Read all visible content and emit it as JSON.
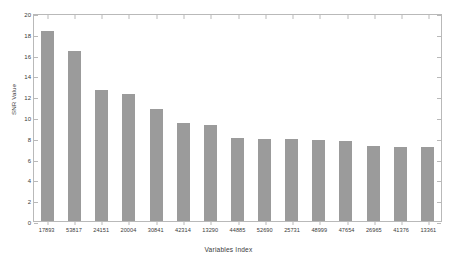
{
  "chart_data": {
    "type": "bar",
    "title": "",
    "xlabel": "Variables Index",
    "ylabel": "SNR Value",
    "categories": [
      "17893",
      "53817",
      "24151",
      "20004",
      "30841",
      "42314",
      "13290",
      "44885",
      "52690",
      "25731",
      "48999",
      "47654",
      "26965",
      "41376",
      "13361"
    ],
    "values": [
      18.3,
      16.3,
      12.6,
      12.2,
      10.8,
      9.4,
      9.2,
      8.0,
      7.9,
      7.9,
      7.8,
      7.7,
      7.2,
      7.1,
      7.1
    ],
    "ylim": [
      0,
      20
    ],
    "yticks": [
      0,
      2,
      4,
      6,
      8,
      10,
      12,
      14,
      16,
      18,
      20
    ],
    "ytick_labels": [
      "0",
      "2",
      "4",
      "6",
      "8",
      "10",
      "12",
      "14",
      "16",
      "18",
      "20"
    ],
    "grid": false,
    "legend": null,
    "bar_color": "#9b9b9b",
    "axis_color": "#b9b9b9",
    "text_color": "#3a3a3a",
    "background": "#ffffff"
  }
}
